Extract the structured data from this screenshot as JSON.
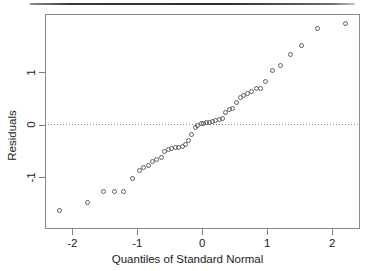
{
  "figure": {
    "background_color": "#ffffff",
    "frame_color": "#8a8a8a",
    "point_color": "#5f5f5f",
    "top_rule_color": "#2e2e2e"
  },
  "chart_data": {
    "type": "scatter",
    "title": "",
    "subtitle": "",
    "xlabel": "Quantiles of Standard Normal",
    "ylabel": "Residuals",
    "xlim": [
      -2.42,
      2.42
    ],
    "ylim": [
      -1.78,
      2.1
    ],
    "xticks": [
      -2,
      -1,
      0,
      1,
      2
    ],
    "xticklabels": [
      "-2",
      "-1",
      "0",
      "1",
      "2"
    ],
    "yticks": [
      -1,
      0,
      1
    ],
    "yticklabels": [
      "-1",
      "0",
      "1"
    ],
    "grid": false,
    "legend": null,
    "annotations": [
      {
        "kind": "hline",
        "y": 0,
        "style": "dotted",
        "label": "zero-residual reference line"
      }
    ],
    "series": [
      {
        "name": "Residuals vs normal quantiles",
        "marker": "open-circle",
        "x": [
          -2.2,
          -1.77,
          -1.52,
          -1.35,
          -1.21,
          -1.08,
          -0.97,
          -0.9,
          -0.83,
          -0.76,
          -0.7,
          -0.63,
          -0.58,
          -0.52,
          -0.47,
          -0.42,
          -0.36,
          -0.31,
          -0.26,
          -0.21,
          -0.16,
          -0.11,
          -0.07,
          -0.02,
          0.02,
          0.07,
          0.11,
          0.16,
          0.21,
          0.26,
          0.31,
          0.36,
          0.42,
          0.47,
          0.52,
          0.58,
          0.63,
          0.7,
          0.76,
          0.83,
          0.9,
          0.97,
          1.08,
          1.21,
          1.35,
          1.52,
          1.77,
          2.2
        ],
        "y": [
          -1.64,
          -1.48,
          -1.28,
          -1.28,
          -1.27,
          -1.03,
          -0.87,
          -0.81,
          -0.78,
          -0.7,
          -0.66,
          -0.63,
          -0.52,
          -0.47,
          -0.45,
          -0.44,
          -0.43,
          -0.42,
          -0.38,
          -0.31,
          -0.19,
          -0.05,
          -0.02,
          0.01,
          0.02,
          0.03,
          0.04,
          0.06,
          0.08,
          0.1,
          0.11,
          0.23,
          0.28,
          0.3,
          0.42,
          0.52,
          0.55,
          0.6,
          0.63,
          0.68,
          0.69,
          0.82,
          1.02,
          1.13,
          1.33,
          1.5,
          1.83,
          1.93
        ]
      }
    ]
  }
}
